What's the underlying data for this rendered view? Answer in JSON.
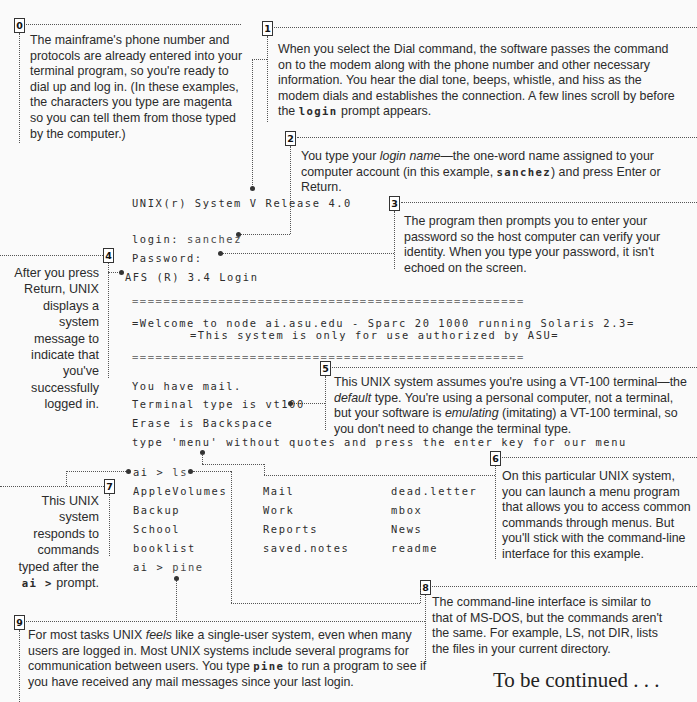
{
  "callouts": [
    {
      "num": "0",
      "text": "The mainframe's phone number and protocols are already entered into your terminal program, so you're ready to dial up and log in. (In these examples, the characters you type are magenta so you can tell them from those typed by the computer.)"
    },
    {
      "num": "1",
      "text_a": "When you select the Dial command, the software passes the command on to the modem along with the phone number and other necessary information. You hear the dial tone, beeps, whistle, and hiss as the modem dials and establishes the connection. A few lines scroll by before the ",
      "code": "login",
      "text_b": " prompt appears."
    },
    {
      "num": "2",
      "text_a": "You type your ",
      "em": "login name",
      "text_b": "—the one-word name assigned to your computer account (in this example, ",
      "code": "sanchez",
      "text_c": ") and press Enter or Return."
    },
    {
      "num": "3",
      "text": "The program then prompts you to enter your password so the host computer can verify your identity. When you type your password, it isn't echoed on the screen."
    },
    {
      "num": "4",
      "text": "After you press Return, UNIX displays a system message to indicate that you've successfully logged in."
    },
    {
      "num": "5",
      "text_a": "This UNIX system assumes you're using a VT-100 terminal—the ",
      "em": "default",
      "text_b": " type. You're using a personal computer, not a terminal, but your software is ",
      "em2": "emulating",
      "text_c": " (imitating) a VT-100 terminal, so you don't need to change the terminal type."
    },
    {
      "num": "6",
      "text": "On this particular UNIX system, you can launch a menu program that allows you to access common commands through menus. But you'll stick with the command-line interface for this example."
    },
    {
      "num": "7",
      "text_a": "This UNIX system responds to commands typed after the ",
      "code": "ai >",
      "text_b": " prompt."
    },
    {
      "num": "8",
      "text": "The command-line interface is similar to that of MS-DOS, but the commands aren't the same. For example, LS, not DIR, lists the files in your current directory."
    },
    {
      "num": "9",
      "text_a": "For most tasks UNIX ",
      "em": "feels",
      "text_b": " like a single-user system, even when many users are logged in. Most UNIX systems include several programs for communication between users. You type ",
      "code": "pine",
      "text_c": " to run a program to see if you have received any mail messages since your last login."
    }
  ],
  "terminal": {
    "release": "UNIX(r) System V Release 4.0",
    "login_label": "login: ",
    "login_value": "sanchez",
    "password_label": "Password:",
    "afs": "AFS (R) 3.4 Login",
    "rule": "==================================================",
    "welcome": "=Welcome to node ai.asu.edu - Sparc 20 1000 running Solaris 2.3=",
    "authorized": "=This system is only for use authorized by ASU=",
    "mail": "You have mail.",
    "termtype": "Terminal type is vt100",
    "erase": "Erase is Backspace",
    "menu_hint": "type 'menu' without quotes and press the enter key for our menu",
    "prompt": "ai > ",
    "cmd_ls": "ls",
    "cmd_pine": "pine",
    "files": [
      [
        "AppleVolumes",
        "Mail",
        "dead.letter"
      ],
      [
        "Backup",
        "Work",
        "mbox"
      ],
      [
        "School",
        "Reports",
        "News"
      ],
      [
        "booklist",
        "saved.notes",
        "readme"
      ]
    ]
  },
  "footer": {
    "continued": "To be continued . . ."
  }
}
